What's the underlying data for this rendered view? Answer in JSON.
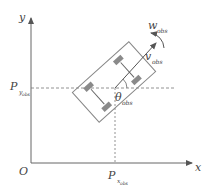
{
  "diagram": {
    "axes": {
      "x_label": "x",
      "y_label": "y",
      "origin_label": "O"
    },
    "position": {
      "px_main": "P",
      "px_sub": "x",
      "px_subsub": "obs",
      "py_main": "P",
      "py_sub": "y",
      "py_subsub": "obs"
    },
    "heading": {
      "main": "θ",
      "sub": "obs"
    },
    "velocity": {
      "main": "v",
      "sub": "obs"
    },
    "angular_velocity": {
      "main": "w",
      "sub": "obs"
    },
    "colors": {
      "line": "#666666",
      "box": "#888888",
      "wheel": "#8a8a8a",
      "text": "#444444",
      "background": "#ffffff"
    }
  }
}
